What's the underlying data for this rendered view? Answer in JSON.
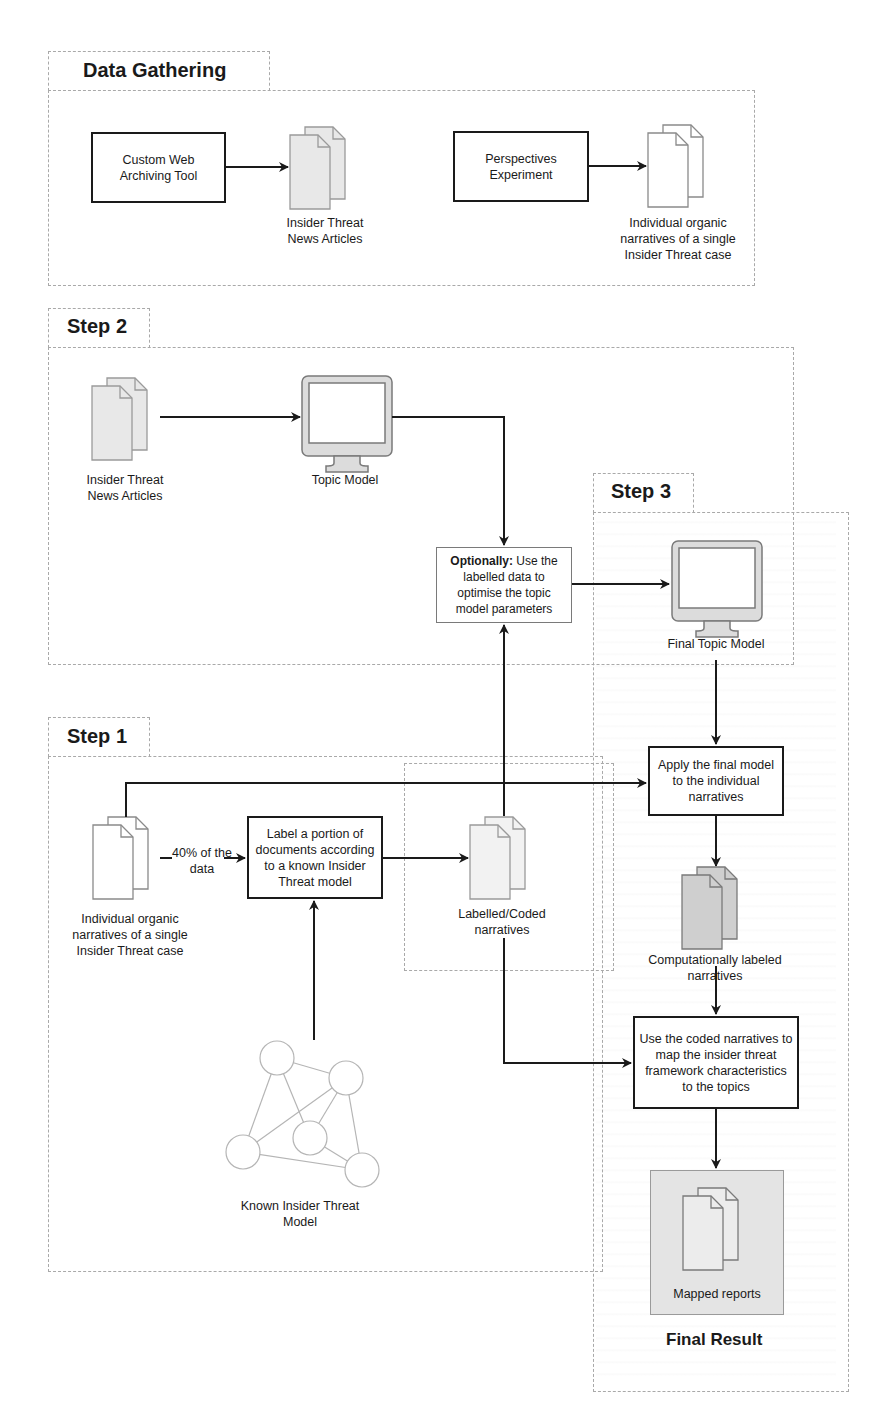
{
  "sections": {
    "data_gathering": {
      "title": "Data Gathering"
    },
    "step2": {
      "title": "Step 2"
    },
    "step3": {
      "title": "Step 3"
    },
    "step1": {
      "title": "Step 1"
    },
    "final": {
      "title": "Final Result"
    }
  },
  "data_gathering": {
    "web_tool": "Custom Web Archiving Tool",
    "news_articles": "Insider Threat News Articles",
    "perspectives": "Perspectives Experiment",
    "narratives": "Individual organic narratives of a single Insider Threat case"
  },
  "step2": {
    "news_articles": "Insider Threat News Articles",
    "topic_model": "Topic Model",
    "optional_bold": "Optionally:",
    "optional_rest": " Use the labelled data to optimise the topic model parameters"
  },
  "step3": {
    "final_topic_model": "Final Topic Model",
    "apply_model": "Apply the final model to the individual narratives",
    "computational_labels": "Computationally labeled narratives",
    "map_characteristics": "Use the coded narratives to map the insider threat framework characteristics to the topics",
    "mapped_reports": "Mapped reports"
  },
  "step1": {
    "narratives": "Individual organic narratives of a single Insider Threat case",
    "portion_label": "40% of the data",
    "label_docs": "Label a portion of documents according to a known Insider Threat model",
    "coded_narratives": "Labelled/Coded narratives",
    "known_model": "Known Insider Threat Model"
  },
  "colors": {
    "stroke": "#1a1a1a",
    "dashed_border": "#a9a9a9",
    "doc_fill_light": "#ececec",
    "doc_fill_dark": "#cfcfcf",
    "final_result_fill": "#e4e4e4"
  }
}
